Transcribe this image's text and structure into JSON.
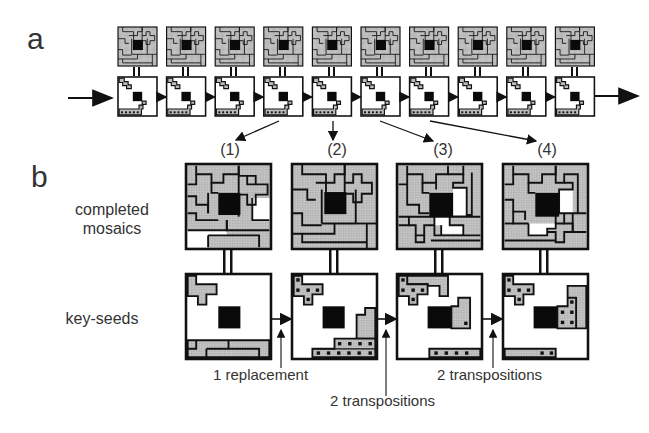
{
  "figure": {
    "panel_a": {
      "label": "a",
      "sequence_count": 10,
      "seed_numbers": [
        "18",
        "12",
        "15",
        "11",
        "15",
        "10",
        "12",
        "11",
        "14",
        "11"
      ],
      "input_arrow": "arrow-right",
      "output_arrow": "arrow-right"
    },
    "panel_b": {
      "label": "b",
      "row_labels": {
        "top_line1": "completed",
        "top_line2": "mosaics",
        "bottom": "key-seeds"
      },
      "columns": [
        {
          "label": "(1)",
          "source_index": 4
        },
        {
          "label": "(2)",
          "source_index": 5
        },
        {
          "label": "(3)",
          "source_index": 7
        },
        {
          "label": "(4)",
          "source_index": 8
        }
      ],
      "transitions": [
        {
          "text": "1 replacement"
        },
        {
          "text": "2 transpositions"
        },
        {
          "text": "2 transpositions"
        }
      ]
    },
    "colors": {
      "tile_gray": "#bdbdbd",
      "border": "#111111",
      "core_black": "#0a0a0a",
      "empty_white": "#ffffff"
    }
  }
}
